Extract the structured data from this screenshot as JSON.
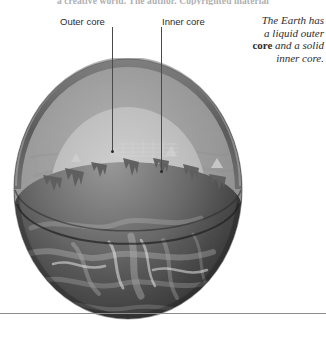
{
  "page": {
    "running_head": "a creative world. The author. Copyrighted material",
    "background_color": "#ffffff",
    "rule_color": "#8d8d8d"
  },
  "labels": [
    {
      "name": "outer-core",
      "text": "Outer core"
    },
    {
      "name": "inner-core",
      "text": "Inner core"
    }
  ],
  "caption": {
    "line1": "The Earth has",
    "line2": "a liquid outer",
    "bold_word": "core",
    "line3_rest": " and a solid",
    "line4": "inner core."
  },
  "illustration": {
    "name": "earth-cutaway-diagram",
    "title": "Cutaway of the Earth showing core layers",
    "layers": [
      {
        "name": "crust",
        "label": "crust",
        "color": "#6f6f6f"
      },
      {
        "name": "mantle",
        "label": "mantle",
        "color": "#8e8e8e"
      },
      {
        "name": "outer-core",
        "label": "liquid outer core",
        "color": "#b9b9b9"
      },
      {
        "name": "inner-core",
        "label": "solid inner core",
        "color": "#fbfbfb"
      }
    ],
    "surface_color": "#3a3a3a"
  }
}
